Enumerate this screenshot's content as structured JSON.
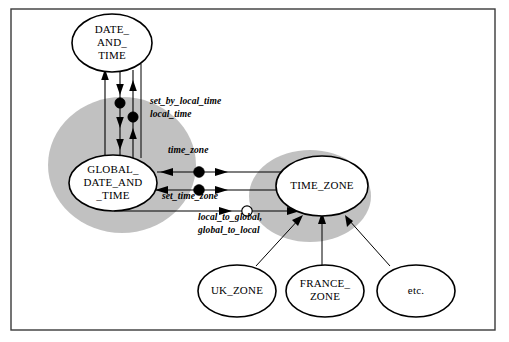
{
  "figure": {
    "kind": "booch-class-diagram",
    "border_color": "#3a3a3a",
    "cloud_color": "#9b9b9b",
    "line_color": "#000000"
  },
  "classes": [
    {
      "id": "date_and_time",
      "label_lines": [
        "DATE_",
        "AND_",
        "TIME"
      ],
      "cx": 112,
      "cy": 43,
      "rx": 40,
      "ry": 29
    },
    {
      "id": "global_date_and_time",
      "label_lines": [
        "GLOBAL_",
        "DATE_AND",
        "_TIME"
      ],
      "cx": 113,
      "cy": 183,
      "rx": 44,
      "ry": 28
    },
    {
      "id": "time_zone",
      "label_lines": [
        "TIME_ZONE"
      ],
      "cx": 322,
      "cy": 186,
      "rx": 46,
      "ry": 30
    },
    {
      "id": "uk_zone",
      "label_lines": [
        "UK_ZONE"
      ],
      "cx": 237,
      "cy": 291,
      "rx": 39,
      "ry": 26
    },
    {
      "id": "france_zone",
      "label_lines": [
        "FRANCE_",
        "ZONE"
      ],
      "cx": 325,
      "cy": 291,
      "rx": 39,
      "ry": 26
    },
    {
      "id": "etc",
      "label_lines": [
        "etc."
      ],
      "cx": 416,
      "cy": 291,
      "rx": 39,
      "ry": 26
    }
  ],
  "clouds": [
    {
      "id": "global-date-and-time-cloud",
      "cx": 122,
      "cy": 165,
      "rx": 74,
      "ry": 68
    },
    {
      "id": "time-zone-cloud",
      "cx": 310,
      "cy": 196,
      "rx": 61,
      "ry": 46
    }
  ],
  "operations": [
    {
      "id": "set_by_local_time",
      "text": "set_by_local_time",
      "x": 150,
      "y": 104
    },
    {
      "id": "local_time",
      "text": "local_time",
      "x": 150,
      "y": 117
    },
    {
      "id": "time_zone",
      "text": "time_zone",
      "x": 168,
      "y": 153
    },
    {
      "id": "set_time_zone",
      "text": "set_time_zone",
      "x": 162,
      "y": 199
    },
    {
      "id": "local_to_global",
      "text": "local_to_global,",
      "x": 198,
      "y": 220
    },
    {
      "id": "global_to_local",
      "text": "global_to_local",
      "x": 198,
      "y": 233
    }
  ],
  "frame": {
    "x": 11,
    "y": 9,
    "width": 484,
    "height": 321
  }
}
